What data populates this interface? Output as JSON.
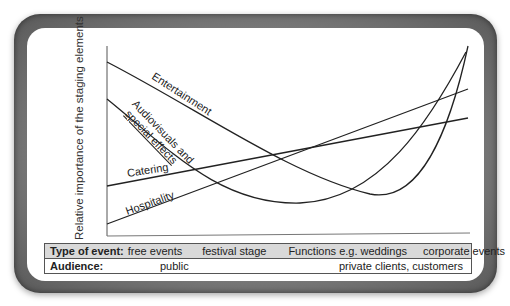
{
  "y_axis_label": "Relative importance of the staging elements",
  "curves": [
    {
      "name": "Entertainment",
      "label": "Entertainment",
      "shape": "decreasing then sharply increasing (U-shape, minimum near corporate-event end)"
    },
    {
      "name": "Audiovisuals and special effects",
      "label_line1": "Audiovisuals and",
      "label_line2": "special effects",
      "shape": "U-shape, minimum in the middle, rising steeply at the right"
    },
    {
      "name": "Catering",
      "label": "Catering",
      "shape": "linear increasing, moderate slope"
    },
    {
      "name": "Hospitality",
      "label": "Hospitality",
      "shape": "linear increasing, steeper slope"
    }
  ],
  "table": {
    "row1": {
      "header": "Type of event:",
      "values": [
        "free events",
        "festival stage",
        "Functions e.g. weddings",
        "corporate events"
      ]
    },
    "row2": {
      "header": "Audience:",
      "values": [
        "public",
        "private clients, customers"
      ]
    }
  },
  "colors": {
    "frame": "#6e6e6e",
    "panel": "#ffffff",
    "line": "#222222",
    "table_header_row": "#d9d9d9"
  }
}
